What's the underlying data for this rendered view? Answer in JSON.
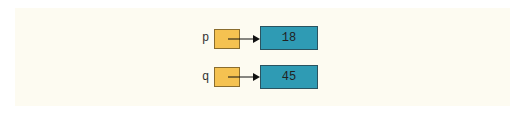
{
  "diagram": {
    "rows": [
      {
        "var": "p",
        "value": "18"
      },
      {
        "var": "q",
        "value": "45"
      }
    ],
    "colors": {
      "pointer_box": "#f5c251",
      "value_box": "#2f9bb4",
      "background": "#fdfbf1"
    }
  }
}
